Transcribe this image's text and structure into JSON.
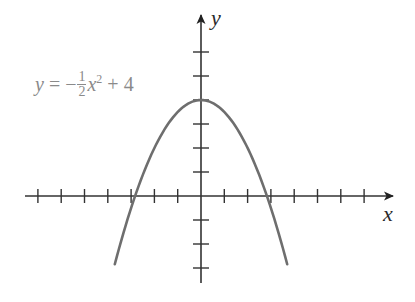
{
  "chart_data": {
    "type": "line",
    "title": "",
    "xlabel": "x",
    "ylabel": "y",
    "annotation": {
      "lhs": "y",
      "equals": "=",
      "sign": "−",
      "numerator": "1",
      "denominator": "2",
      "var": "x",
      "exponent": "2",
      "plus": "+",
      "constant": "4"
    },
    "function": "y = -1/2 x^2 + 4",
    "series": [
      {
        "name": "y = -1/2 x^2 + 4",
        "x": [
          -3.7,
          -3,
          -2.83,
          -2,
          -1,
          0,
          1,
          2,
          2.83,
          3,
          3.7
        ],
        "y": [
          -2.85,
          -0.5,
          0,
          2,
          3.5,
          4,
          3.5,
          2,
          0,
          -0.5,
          -2.85
        ]
      }
    ],
    "xlim": [
      -7.5,
      8.4
    ],
    "ylim": [
      -3.6,
      7.6
    ],
    "x_ticks": [
      -7,
      -6,
      -5,
      -4,
      -3,
      -2,
      -1,
      1,
      2,
      3,
      4,
      5,
      6,
      7
    ],
    "y_ticks": [
      -3,
      -2,
      -1,
      1,
      2,
      3,
      4,
      5,
      6
    ],
    "tick_labels_shown": false,
    "grid": false,
    "legend": "none",
    "colors": {
      "axis": "#333333",
      "curve": "#6e6e6e",
      "annotation": "#8a8a8a"
    }
  }
}
